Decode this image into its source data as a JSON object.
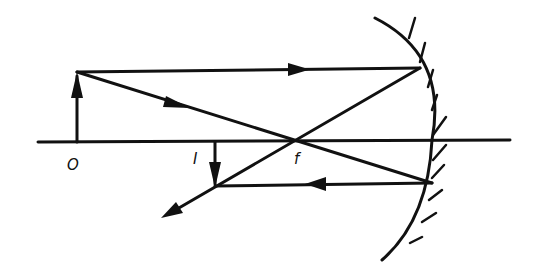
{
  "diagram": {
    "type": "ray-diagram",
    "ink_color": "#111111",
    "background": "#ffffff",
    "labels": {
      "object": "O",
      "image": "I",
      "focus": "f"
    },
    "elements": {
      "principal_axis": {
        "x1": 38,
        "y1": 142,
        "x2": 510,
        "y2": 140
      },
      "object_arrow": {
        "x": 77,
        "base_y": 142,
        "tip_y": 72,
        "direction": "up"
      },
      "image_arrow": {
        "x": 215,
        "base_y": 142,
        "tip_y": 186,
        "direction": "down"
      },
      "focal_point": {
        "x": 292,
        "y": 140
      },
      "mirror": {
        "type": "concave",
        "top": [
          375,
          18
        ],
        "vertex": [
          432,
          140
        ],
        "bottom": [
          382,
          260
        ]
      },
      "rays": [
        {
          "name": "parallel-incident-ray",
          "from": [
            77,
            72
          ],
          "to": [
            420,
            68
          ]
        },
        {
          "name": "focal-incident-ray",
          "from": [
            77,
            72
          ],
          "to": [
            432,
            183
          ]
        },
        {
          "name": "reflected-through-focus-ray",
          "from": [
            420,
            68
          ],
          "to": [
            163,
            217
          ]
        },
        {
          "name": "reflected-parallel-ray",
          "from": [
            432,
            183
          ],
          "to": [
            215,
            186
          ]
        }
      ]
    }
  }
}
